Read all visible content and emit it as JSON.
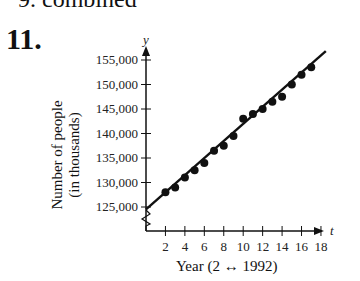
{
  "header": {
    "previous_fragment": "9. combined",
    "problem_number": "11."
  },
  "chart_data": {
    "type": "scatter",
    "title": "",
    "xlabel": "Year (2 ↔ 1992)",
    "ylabel": "Number of people (in thousands)",
    "x_axis_symbol": "t",
    "y_axis_symbol": "y",
    "x_ticks": [
      2,
      4,
      6,
      8,
      10,
      12,
      14,
      16,
      18
    ],
    "y_ticks": [
      125000,
      130000,
      135000,
      140000,
      145000,
      150000,
      155000
    ],
    "y_tick_labels": [
      "125,000",
      "130,000",
      "135,000",
      "140,000",
      "145,000",
      "150,000",
      "155,000"
    ],
    "xlim": [
      0,
      19
    ],
    "ylim": [
      123000,
      158000
    ],
    "axis_break": "y",
    "grid": false,
    "series": [
      {
        "name": "data",
        "x": [
          2,
          3,
          4,
          5,
          6,
          7,
          8,
          9,
          10,
          11,
          12,
          13,
          14,
          15,
          16,
          17
        ],
        "y": [
          128000,
          129000,
          131000,
          132500,
          134000,
          136500,
          137500,
          139500,
          143000,
          144000,
          145000,
          146500,
          147500,
          150000,
          152000,
          153500
        ]
      }
    ],
    "trend_line": {
      "x": [
        0,
        18.5
      ],
      "y": [
        124500,
        156800
      ]
    }
  },
  "labels": {
    "ylabel_line1": "Number of people",
    "ylabel_line2": "(in thousands)",
    "xlabel": "Year (2 ↔ 1992)"
  }
}
